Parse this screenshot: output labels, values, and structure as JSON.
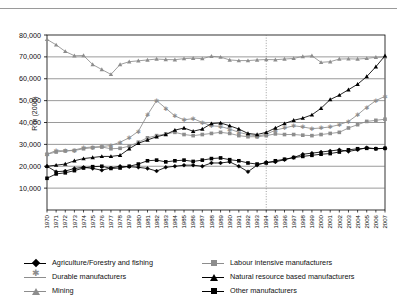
{
  "top_caption": "",
  "axes": {
    "ylabel": "R'm (2000)",
    "yticks": [
      "10,000",
      "20,000",
      "30,000",
      "40,000",
      "50,000",
      "60,000",
      "70,000",
      "80,000"
    ],
    "ylim_min": 0,
    "ylim_max": 80000
  },
  "legend": {
    "left": [
      {
        "label": "Agriculture/Forestry and fishing",
        "marker": "diamond",
        "color": "#000000"
      },
      {
        "label": "Durable manufacturers",
        "marker": "star",
        "color": "#8d8d8d"
      },
      {
        "label": "Mining",
        "marker": "triangle",
        "color": "#8d8d8d"
      }
    ],
    "right": [
      {
        "label": "Labour intensive manufacturers",
        "marker": "square",
        "color": "#8d8d8d"
      },
      {
        "label": "Natural resource based manufacturers",
        "marker": "triangle",
        "color": "#000000"
      },
      {
        "label": "Other manufacturers",
        "marker": "square",
        "color": "#000000"
      }
    ]
  },
  "annotations": {
    "vline_year": 1994
  },
  "chart_data": {
    "type": "line",
    "title": "",
    "xlabel": "",
    "ylabel": "R'm (2000)",
    "ylim": [
      0,
      80000
    ],
    "grid": true,
    "legend_position": "bottom",
    "x": [
      1970,
      1971,
      1972,
      1973,
      1974,
      1975,
      1976,
      1977,
      1978,
      1979,
      1980,
      1981,
      1982,
      1983,
      1984,
      1985,
      1986,
      1987,
      1988,
      1989,
      1990,
      1991,
      1992,
      1993,
      1994,
      1995,
      1996,
      1997,
      1998,
      1999,
      2000,
      2001,
      2002,
      2003,
      2004,
      2005,
      2006,
      2007
    ],
    "series": [
      {
        "name": "Mining",
        "marker": "triangle",
        "color": "#8d8d8d",
        "values": [
          78000,
          75500,
          72500,
          70500,
          70600,
          66500,
          64200,
          62000,
          66500,
          67800,
          68200,
          68600,
          69000,
          68800,
          68700,
          69200,
          69400,
          69200,
          70300,
          69900,
          68600,
          68300,
          68300,
          68600,
          68800,
          68700,
          69000,
          69300,
          70200,
          70500,
          67500,
          67800,
          69000,
          69100,
          69000,
          69300,
          69800,
          70000
        ]
      },
      {
        "name": "Durable manufacturers",
        "marker": "star",
        "color": "#8d8d8d",
        "values": [
          25500,
          27200,
          27000,
          27400,
          28500,
          28800,
          29000,
          29500,
          31000,
          33000,
          36000,
          43500,
          50000,
          46500,
          43000,
          41200,
          41800,
          40000,
          38500,
          38200,
          37000,
          35500,
          34500,
          33800,
          34600,
          36500,
          37500,
          38500,
          38000,
          37200,
          37500,
          38000,
          39000,
          40500,
          43500,
          47000,
          50000,
          52000
        ]
      },
      {
        "name": "Labour intensive manufacturers",
        "marker": "square",
        "color": "#8d8d8d",
        "values": [
          25500,
          26500,
          27000,
          27200,
          28000,
          28500,
          28800,
          28000,
          28200,
          29200,
          31000,
          33000,
          34000,
          34800,
          35500,
          34500,
          34000,
          34500,
          35000,
          35500,
          35000,
          34000,
          33500,
          33500,
          34000,
          34800,
          34500,
          34500,
          34200,
          34000,
          34500,
          35000,
          35500,
          37500,
          39000,
          40500,
          41000,
          41500
        ]
      },
      {
        "name": "Natural resource based manufacturers",
        "marker": "triangle",
        "color": "#000000",
        "values": [
          20000,
          20500,
          21000,
          22500,
          23500,
          24000,
          24500,
          24500,
          25000,
          28000,
          30500,
          32000,
          33500,
          34500,
          36500,
          37500,
          36000,
          37000,
          39500,
          39800,
          38500,
          37000,
          35000,
          34500,
          35500,
          37500,
          39500,
          41000,
          42000,
          43500,
          46500,
          50500,
          52500,
          55000,
          57500,
          61000,
          65500,
          70500
        ]
      },
      {
        "name": "Other manufacturers",
        "marker": "square",
        "color": "#000000",
        "values": [
          14500,
          16500,
          17000,
          18000,
          19200,
          19800,
          20000,
          19000,
          19200,
          20000,
          21000,
          22500,
          22800,
          22000,
          22500,
          22800,
          22200,
          22800,
          23500,
          23800,
          23000,
          22500,
          21500,
          21000,
          21500,
          22500,
          23200,
          24000,
          24500,
          25000,
          25500,
          25800,
          26500,
          27500,
          28000,
          28200,
          28000,
          28200
        ]
      },
      {
        "name": "Agriculture/Forestry and fishing",
        "marker": "diamond",
        "color": "#000000",
        "values": [
          20000,
          17500,
          17800,
          19000,
          19500,
          19000,
          18200,
          19200,
          20000,
          19800,
          19500,
          19000,
          17800,
          19500,
          20000,
          20500,
          20500,
          20000,
          21500,
          21500,
          22000,
          20000,
          17500,
          20500,
          21800,
          22000,
          23000,
          24000,
          25500,
          26000,
          26500,
          27000,
          27500,
          26800,
          27500,
          28500,
          28000,
          28200
        ]
      }
    ]
  }
}
